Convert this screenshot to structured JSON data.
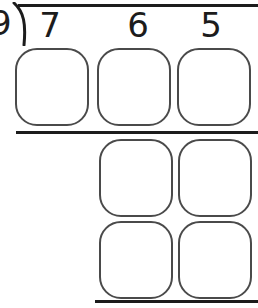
{
  "problem": {
    "type": "long-division",
    "divisor": "9",
    "dividend_digits": [
      "7",
      "6",
      "5"
    ],
    "dividend": "765",
    "bracket_icon": "division-bracket-icon"
  },
  "rules": {
    "vinculum_label": "vinculum",
    "row1_rule_label": "subtraction-rule-1",
    "row3_rule_label": "subtraction-rule-2"
  },
  "answer_rows": [
    {
      "row_label": "quotient-row",
      "boxes": [
        {
          "name": "answer-box-r0c0",
          "value": ""
        },
        {
          "name": "answer-box-r0c1",
          "value": ""
        },
        {
          "name": "answer-box-r0c2",
          "value": ""
        }
      ]
    },
    {
      "row_label": "work-row-1",
      "boxes": [
        {
          "name": "answer-box-r1c0",
          "value": ""
        },
        {
          "name": "answer-box-r1c1",
          "value": ""
        }
      ]
    },
    {
      "row_label": "work-row-2",
      "boxes": [
        {
          "name": "answer-box-r2c0",
          "value": ""
        },
        {
          "name": "answer-box-r2c1",
          "value": ""
        }
      ]
    }
  ],
  "colors": {
    "ink": "#1c1c1c",
    "box_border": "#4a4a4a",
    "paper": "#ffffff"
  }
}
